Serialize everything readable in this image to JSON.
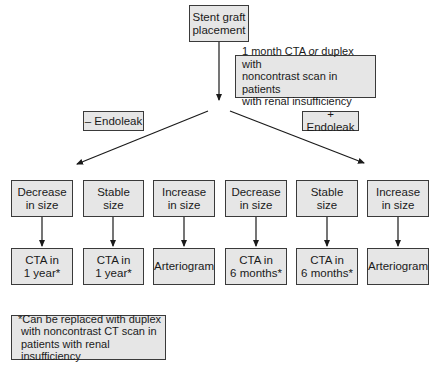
{
  "diagram": {
    "root": {
      "label_line1": "Stent graft",
      "label_line2": "placement"
    },
    "note": {
      "line1_pre": "1 month CTA ",
      "line1_italic": "or",
      "line1_post": " duplex with",
      "line2": "noncontrast scan in patients",
      "line3": "with renal insufficiency"
    },
    "branches": {
      "negative": {
        "label": "– Endoleak"
      },
      "positive": {
        "label": "+ Endoleak"
      }
    },
    "outcomes": [
      {
        "line1": "Decrease",
        "line2": "in size",
        "action_line1": "CTA in",
        "action_line2": "1 year*"
      },
      {
        "line1": "Stable",
        "line2": "size",
        "action_line1": "CTA in",
        "action_line2": "1 year*"
      },
      {
        "line1": "Increase",
        "line2": "in size",
        "action_line1": "Arteriogram",
        "action_line2": ""
      },
      {
        "line1": "Decrease",
        "line2": "in size",
        "action_line1": "CTA in",
        "action_line2": "6 months*"
      },
      {
        "line1": "Stable",
        "line2": "size",
        "action_line1": "CTA in",
        "action_line2": "6 months*"
      },
      {
        "line1": "Increase",
        "line2": "in size",
        "action_line1": "Arteriogram",
        "action_line2": ""
      }
    ],
    "footnote": {
      "line1": "*Can be replaced with duplex",
      "line2": "with noncontrast CT scan in",
      "line3": "patients with renal insufficiency"
    },
    "colors": {
      "box_fill": "#e6e6e6",
      "border": "#3a3a3a",
      "line": "#1a1a1a"
    }
  }
}
